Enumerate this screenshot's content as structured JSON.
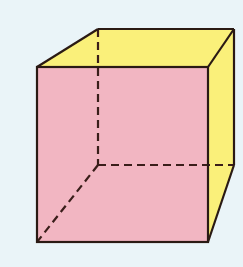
{
  "diagram": {
    "type": "cube",
    "colors": {
      "background": "#eaf4f8",
      "front_face": "#f2b6c2",
      "side_faces": "#faf07a",
      "edge": "#2a1a14",
      "hidden_edge": "#3a1e1a"
    },
    "vertices": {
      "front_top_left": [
        37,
        67
      ],
      "front_top_right": [
        208,
        67
      ],
      "front_bottom_left": [
        37,
        242
      ],
      "front_bottom_right": [
        208,
        242
      ],
      "back_top_left": [
        98,
        29
      ],
      "back_top_right": [
        234,
        29
      ],
      "back_bottom_left": [
        98,
        165
      ],
      "back_bottom_right": [
        234,
        165
      ]
    },
    "hidden_edges": [
      "back_top_left-back_bottom_left",
      "back_bottom_left-back_bottom_right",
      "back_bottom_left-front_bottom_left"
    ]
  }
}
